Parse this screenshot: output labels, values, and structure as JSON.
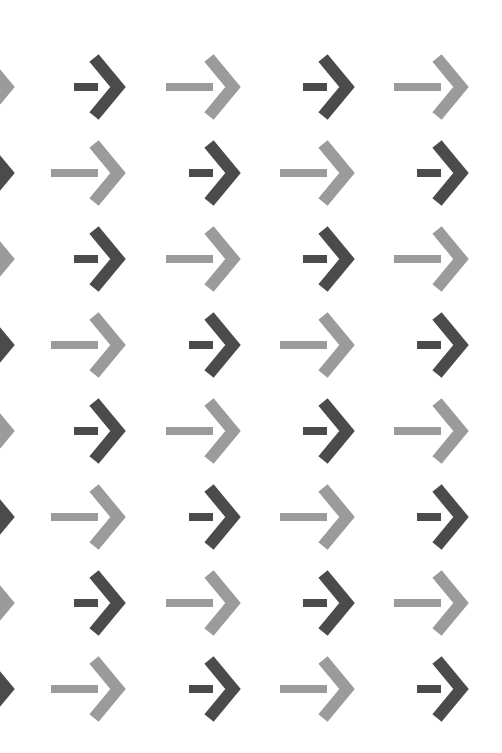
{
  "illusion": {
    "title": "",
    "background": "#ffffff",
    "colors": {
      "dark": "#4b4b4b",
      "light": "#9b9b9b"
    },
    "row_centers_y": [
      87,
      173,
      259,
      345,
      431,
      517,
      603,
      689
    ],
    "column_tips_x": [
      13,
      124,
      239,
      353,
      467
    ],
    "arrow": {
      "shaft_thickness": 8,
      "chevron_thickness": 12,
      "chevron_half_height": 29,
      "chevron_depth": 30,
      "dark_shaft_length": 24,
      "light_shaft_length": 47
    },
    "rows": [
      {
        "tones": [
          "light",
          "dark",
          "light",
          "dark",
          "light"
        ]
      },
      {
        "tones": [
          "dark",
          "light",
          "dark",
          "light",
          "dark"
        ]
      },
      {
        "tones": [
          "light",
          "dark",
          "light",
          "dark",
          "light"
        ]
      },
      {
        "tones": [
          "dark",
          "light",
          "dark",
          "light",
          "dark"
        ]
      },
      {
        "tones": [
          "light",
          "dark",
          "light",
          "dark",
          "light"
        ]
      },
      {
        "tones": [
          "dark",
          "light",
          "dark",
          "light",
          "dark"
        ]
      },
      {
        "tones": [
          "light",
          "dark",
          "light",
          "dark",
          "light"
        ]
      },
      {
        "tones": [
          "dark",
          "light",
          "dark",
          "light",
          "dark"
        ]
      }
    ]
  }
}
